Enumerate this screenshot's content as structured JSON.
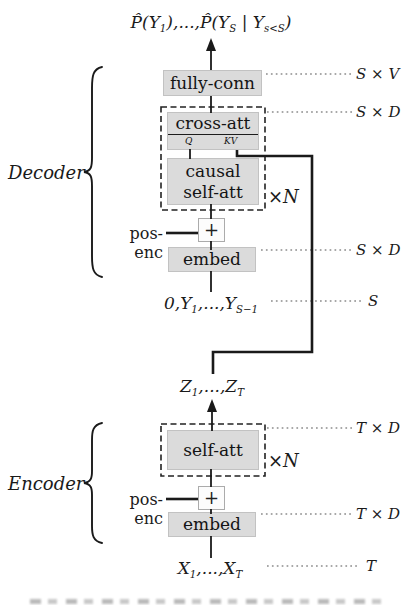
{
  "title_formula": {
    "seg1": "P̂(Y",
    "sub1": "1",
    "seg2": "),...,P̂(Y",
    "sub2": "S",
    "seg3": " | Y",
    "sub3": "s<S",
    "seg4": ")"
  },
  "decoder": {
    "label": "Decoder",
    "fully_conn_label": "fully-conn",
    "cross_att_label": "cross-att",
    "q_label": "Q",
    "kv_label": "KV",
    "causal_self_att_line1": "causal",
    "causal_self_att_line2": "self-att",
    "repeat_label": "×N",
    "pos_enc_label": "pos-enc",
    "plus_label": "+",
    "embed_label": "embed",
    "input_formula": {
      "seg1": "0,Y",
      "sub1": "1",
      "seg2": ",...,Y",
      "sub2": "S−1"
    }
  },
  "latent_formula": {
    "seg1": "Z",
    "sub1": "1",
    "seg2": ",...,Z",
    "sub2": "T"
  },
  "encoder": {
    "label": "Encoder",
    "self_att_label": "self-att",
    "repeat_label": "×N",
    "pos_enc_label": "pos-enc",
    "plus_label": "+",
    "embed_label": "embed",
    "input_formula": {
      "seg1": "X",
      "sub1": "1",
      "seg2": ",...,X",
      "sub2": "T"
    }
  },
  "dim_labels": {
    "fully_conn_out": "S × V",
    "decoder_block_out": "S × D",
    "decoder_embed_out": "S × D",
    "decoder_input_len": "S",
    "encoder_block_out": "T × D",
    "encoder_embed_out": "T × D",
    "encoder_input_len": "T"
  },
  "colors": {
    "box_fill": "#dbdbdb",
    "box_border": "#c2c2c2",
    "line": "#1a1a1a",
    "leader_dots": "#8c8c8c"
  }
}
